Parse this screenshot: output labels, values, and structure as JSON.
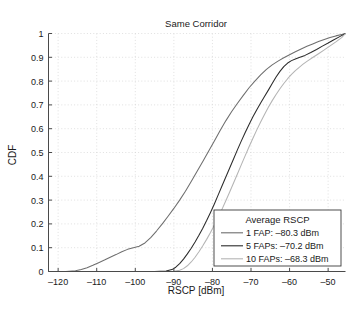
{
  "chart_data": {
    "type": "line",
    "title": "Same Corridor",
    "xlabel": "RSCP [dBm]",
    "ylabel": "CDF",
    "xlim": [
      -122.5,
      -45.5
    ],
    "ylim": [
      0,
      1
    ],
    "xticks": [
      "-120",
      "-110",
      "-100",
      "-90",
      "-80",
      "-70",
      "-60",
      "-50"
    ],
    "xtick_values": [
      -120,
      -110,
      -100,
      -90,
      -80,
      -70,
      -60,
      -50
    ],
    "yticks": [
      "0",
      "0.1",
      "0.2",
      "0.3",
      "0.4",
      "0.5",
      "0.6",
      "0.7",
      "0.8",
      "0.9",
      "1"
    ],
    "ytick_values": [
      0,
      0.1,
      0.2,
      0.3,
      0.4,
      0.5,
      0.6,
      0.7,
      0.8,
      0.9,
      1
    ],
    "grid": true,
    "legend_position": "lower-right",
    "legend_title": "Average RSCP",
    "series": [
      {
        "name": "1 FAP: -80.3 dBm",
        "label": "1 FAP: –80.3 dBm",
        "color": "#6e6e6e",
        "average_rscp_dbm": -80.3,
        "points": [
          [
            -122.5,
            0.0
          ],
          [
            -118.0,
            0.0
          ],
          [
            -115.5,
            0.003
          ],
          [
            -114.0,
            0.008
          ],
          [
            -112.5,
            0.016
          ],
          [
            -111.0,
            0.026
          ],
          [
            -109.5,
            0.037
          ],
          [
            -108.0,
            0.048
          ],
          [
            -106.5,
            0.06
          ],
          [
            -105.0,
            0.071
          ],
          [
            -103.5,
            0.083
          ],
          [
            -102.0,
            0.093
          ],
          [
            -100.5,
            0.1
          ],
          [
            -99.0,
            0.106
          ],
          [
            -97.5,
            0.12
          ],
          [
            -96.0,
            0.142
          ],
          [
            -94.5,
            0.17
          ],
          [
            -93.0,
            0.2
          ],
          [
            -91.5,
            0.232
          ],
          [
            -90.0,
            0.265
          ],
          [
            -88.5,
            0.3
          ],
          [
            -87.0,
            0.337
          ],
          [
            -85.5,
            0.378
          ],
          [
            -84.0,
            0.42
          ],
          [
            -82.5,
            0.462
          ],
          [
            -81.0,
            0.505
          ],
          [
            -79.5,
            0.548
          ],
          [
            -78.0,
            0.592
          ],
          [
            -76.5,
            0.634
          ],
          [
            -75.0,
            0.672
          ],
          [
            -73.5,
            0.707
          ],
          [
            -72.0,
            0.74
          ],
          [
            -70.5,
            0.772
          ],
          [
            -69.0,
            0.8
          ],
          [
            -67.5,
            0.826
          ],
          [
            -66.0,
            0.849
          ],
          [
            -64.5,
            0.868
          ],
          [
            -63.0,
            0.884
          ],
          [
            -61.5,
            0.898
          ],
          [
            -60.0,
            0.911
          ],
          [
            -58.5,
            0.923
          ],
          [
            -57.0,
            0.935
          ],
          [
            -55.5,
            0.946
          ],
          [
            -54.0,
            0.956
          ],
          [
            -52.5,
            0.966
          ],
          [
            -51.0,
            0.975
          ],
          [
            -49.5,
            0.983
          ],
          [
            -48.0,
            0.99
          ],
          [
            -46.5,
            0.996
          ],
          [
            -45.5,
            1.0
          ]
        ]
      },
      {
        "name": "5 FAPs: -70.2 dBm",
        "label": "5 FAPs: –70.2 dBm",
        "color": "#2b2b2b",
        "average_rscp_dbm": -70.2,
        "points": [
          [
            -122.5,
            0.0
          ],
          [
            -95.0,
            0.0
          ],
          [
            -92.0,
            0.002
          ],
          [
            -90.5,
            0.008
          ],
          [
            -89.5,
            0.018
          ],
          [
            -88.5,
            0.033
          ],
          [
            -87.5,
            0.052
          ],
          [
            -86.5,
            0.074
          ],
          [
            -85.5,
            0.098
          ],
          [
            -84.5,
            0.124
          ],
          [
            -83.5,
            0.152
          ],
          [
            -82.5,
            0.182
          ],
          [
            -81.5,
            0.214
          ],
          [
            -80.5,
            0.248
          ],
          [
            -79.5,
            0.284
          ],
          [
            -78.5,
            0.322
          ],
          [
            -77.5,
            0.36
          ],
          [
            -76.5,
            0.398
          ],
          [
            -75.5,
            0.436
          ],
          [
            -74.5,
            0.474
          ],
          [
            -73.5,
            0.512
          ],
          [
            -72.5,
            0.549
          ],
          [
            -71.5,
            0.584
          ],
          [
            -70.5,
            0.618
          ],
          [
            -69.5,
            0.65
          ],
          [
            -68.5,
            0.68
          ],
          [
            -67.5,
            0.708
          ],
          [
            -66.5,
            0.735
          ],
          [
            -65.5,
            0.762
          ],
          [
            -64.5,
            0.79
          ],
          [
            -63.5,
            0.817
          ],
          [
            -62.5,
            0.841
          ],
          [
            -61.5,
            0.861
          ],
          [
            -60.5,
            0.876
          ],
          [
            -59.5,
            0.886
          ],
          [
            -58.5,
            0.893
          ],
          [
            -57.5,
            0.899
          ],
          [
            -56.0,
            0.908
          ],
          [
            -54.5,
            0.92
          ],
          [
            -53.0,
            0.933
          ],
          [
            -51.5,
            0.947
          ],
          [
            -50.0,
            0.96
          ],
          [
            -48.5,
            0.974
          ],
          [
            -47.0,
            0.987
          ],
          [
            -45.5,
            1.0
          ]
        ]
      },
      {
        "name": "10 FAPs: -68.3 dBm",
        "label": "10 FAPs: –68.3 dBm",
        "color": "#b4b4b4",
        "average_rscp_dbm": -68.3,
        "points": [
          [
            -122.5,
            0.0
          ],
          [
            -93.0,
            0.0
          ],
          [
            -90.0,
            0.001
          ],
          [
            -88.5,
            0.005
          ],
          [
            -87.5,
            0.012
          ],
          [
            -86.5,
            0.024
          ],
          [
            -85.5,
            0.04
          ],
          [
            -84.5,
            0.06
          ],
          [
            -83.5,
            0.083
          ],
          [
            -82.5,
            0.108
          ],
          [
            -81.5,
            0.135
          ],
          [
            -80.5,
            0.164
          ],
          [
            -79.5,
            0.195
          ],
          [
            -78.5,
            0.228
          ],
          [
            -77.5,
            0.262
          ],
          [
            -76.5,
            0.298
          ],
          [
            -75.5,
            0.335
          ],
          [
            -74.5,
            0.373
          ],
          [
            -73.5,
            0.411
          ],
          [
            -72.5,
            0.449
          ],
          [
            -71.5,
            0.487
          ],
          [
            -70.5,
            0.524
          ],
          [
            -69.5,
            0.56
          ],
          [
            -68.5,
            0.595
          ],
          [
            -67.5,
            0.628
          ],
          [
            -66.5,
            0.66
          ],
          [
            -65.5,
            0.69
          ],
          [
            -64.5,
            0.718
          ],
          [
            -63.5,
            0.744
          ],
          [
            -62.5,
            0.768
          ],
          [
            -61.5,
            0.79
          ],
          [
            -60.5,
            0.81
          ],
          [
            -59.5,
            0.828
          ],
          [
            -58.5,
            0.844
          ],
          [
            -57.5,
            0.858
          ],
          [
            -56.5,
            0.871
          ],
          [
            -55.5,
            0.883
          ],
          [
            -54.0,
            0.899
          ],
          [
            -52.5,
            0.915
          ],
          [
            -51.0,
            0.931
          ],
          [
            -49.5,
            0.948
          ],
          [
            -48.0,
            0.965
          ],
          [
            -46.5,
            0.983
          ],
          [
            -45.5,
            1.0
          ]
        ]
      }
    ]
  }
}
